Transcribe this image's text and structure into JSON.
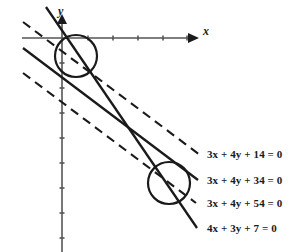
{
  "figure": {
    "background_color": "#ffffff",
    "stroke_color": "#1a1a1a",
    "axis_color": "#555555"
  },
  "axes": {
    "x_axis": {
      "label": "x",
      "label_x": 203,
      "label_y": 24,
      "start_x": 22,
      "end_x": 196,
      "y": 38,
      "ticks_x": [
        88,
        113,
        138,
        163,
        187
      ],
      "tick_length": 5,
      "arrow": "right"
    },
    "y_axis": {
      "label": "y",
      "label_x": 58,
      "label_y": 4,
      "x": 62,
      "start_y": 252,
      "end_y": 16,
      "ticks_y": [
        63,
        88,
        113,
        138,
        163,
        188,
        213,
        238
      ],
      "tick_length": 5,
      "arrow": "up"
    }
  },
  "circles": [
    {
      "name": "upper-circle",
      "cx": 76,
      "cy": 56,
      "r": 21,
      "stroke_width": 2.2
    },
    {
      "name": "lower-circle",
      "cx": 169,
      "cy": 183,
      "r": 21,
      "stroke_width": 2.2
    }
  ],
  "lines": [
    {
      "name": "line-3x-4y-14",
      "equation": "3x + 4y + 14 = 0",
      "style": "dashed",
      "slope": -0.75,
      "x1": 23,
      "y1": 22,
      "x2": 200,
      "y2": 155,
      "label_x": 207,
      "label_y": 148
    },
    {
      "name": "line-3x-4y-34",
      "equation": "3x + 4y + 34 = 0",
      "style": "solid",
      "slope": -0.75,
      "x1": 23,
      "y1": 48,
      "x2": 198,
      "y2": 180,
      "label_x": 207,
      "label_y": 174
    },
    {
      "name": "line-3x-4y-54",
      "equation": "3x + 4y + 54 = 0",
      "style": "dashed",
      "slope": -0.75,
      "x1": 23,
      "y1": 73,
      "x2": 196,
      "y2": 203,
      "label_x": 207,
      "label_y": 197
    },
    {
      "name": "line-4x-3y-7",
      "equation": "4x + 3y + 7 = 0",
      "style": "solid",
      "slope": -1.3333,
      "x1": 46,
      "y1": 7,
      "x2": 197,
      "y2": 228,
      "label_x": 207,
      "label_y": 222
    }
  ]
}
